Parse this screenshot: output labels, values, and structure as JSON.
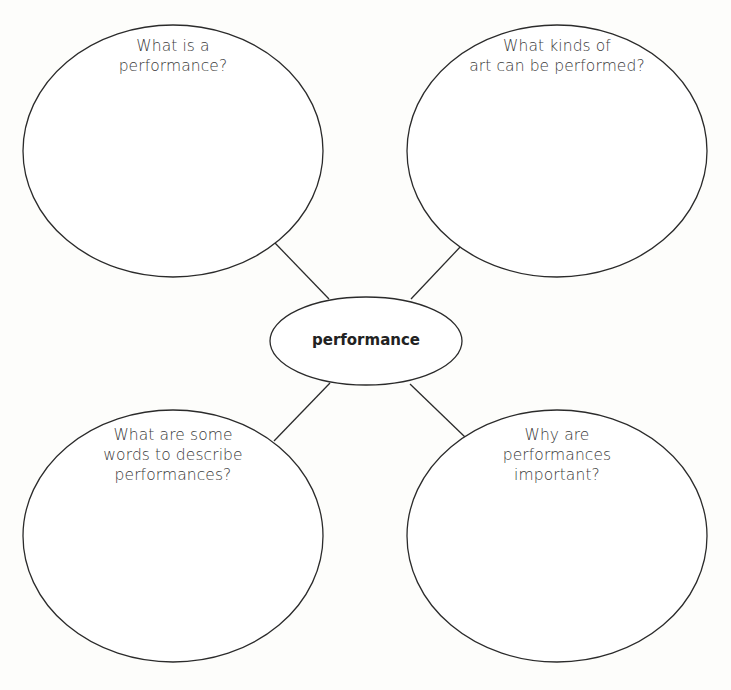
{
  "diagram": {
    "type": "concept-web",
    "colors": {
      "background": "#fdfdfb",
      "stroke": "#2b2b2b",
      "text": "#3a3a3a",
      "center_text": "#222222"
    },
    "center": {
      "label": "performance"
    },
    "nodes": [
      {
        "position": "top-left",
        "lines": [
          "What is a",
          "performance?"
        ]
      },
      {
        "position": "top-right",
        "lines": [
          "What kinds of",
          "art can be performed?"
        ]
      },
      {
        "position": "bottom-left",
        "lines": [
          "What are some",
          "words to describe",
          "performances?"
        ]
      },
      {
        "position": "bottom-right",
        "lines": [
          "Why are",
          "performances",
          "important?"
        ]
      }
    ]
  }
}
